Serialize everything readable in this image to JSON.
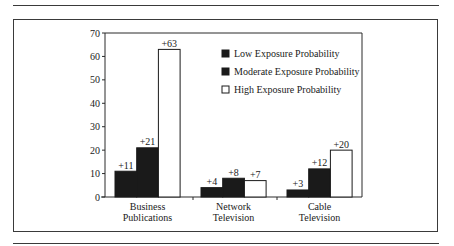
{
  "chart_data": {
    "type": "bar",
    "title": "",
    "xlabel": "",
    "ylabel": "",
    "ylim": [
      0,
      70
    ],
    "yticks": [
      0,
      10,
      20,
      30,
      40,
      50,
      60,
      70
    ],
    "grid": false,
    "legend_position": "upper right inside plot",
    "categories": [
      "Business\nPublications",
      "Network\nTelevision",
      "Cable\nTelevision"
    ],
    "category_lines": [
      [
        "Business",
        "Publications"
      ],
      [
        "Network",
        "Television"
      ],
      [
        "Cable",
        "Television"
      ]
    ],
    "series": [
      {
        "name": "Low Exposure Probability",
        "fill": "#1a1a1a",
        "values": [
          11,
          4,
          3
        ],
        "labels": [
          "+11",
          "+4",
          "+3"
        ]
      },
      {
        "name": "Moderate Exposure Probability",
        "fill": "#1a1a1a",
        "values": [
          21,
          8,
          12
        ],
        "labels": [
          "+21",
          "+8",
          "+12"
        ]
      },
      {
        "name": "High Exposure Probability",
        "fill": "#ffffff",
        "values": [
          63,
          7,
          20
        ],
        "labels": [
          "+63",
          "+7",
          "+20"
        ]
      }
    ]
  },
  "colors": {
    "axis": "#2a2a2a",
    "dark_bar": "#1a1a1a",
    "light_bar": "#ffffff"
  }
}
